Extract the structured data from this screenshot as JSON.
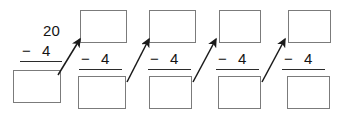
{
  "worksheet": {
    "title": "repeated-subtraction-chain",
    "start_value": "20",
    "operator_sign": "−",
    "operand": "4",
    "num_columns": 5,
    "colors": {
      "box_border": "#7b7b7b",
      "text": "#141414",
      "rule": "#2b2b2b",
      "arrow": "#1a1a1a",
      "background": "#ffffff"
    },
    "columns": [
      {
        "index": 1,
        "top_kind": "number",
        "top_value": "20",
        "operator_sign": "−",
        "operand": "4",
        "bottom_kind": "box",
        "bottom_value": ""
      },
      {
        "index": 2,
        "top_kind": "box",
        "top_value": "",
        "operator_sign": "−",
        "operand": "4",
        "bottom_kind": "box",
        "bottom_value": ""
      },
      {
        "index": 3,
        "top_kind": "box",
        "top_value": "",
        "operator_sign": "−",
        "operand": "4",
        "bottom_kind": "box",
        "bottom_value": ""
      },
      {
        "index": 4,
        "top_kind": "box",
        "top_value": "",
        "operator_sign": "−",
        "operand": "4",
        "bottom_kind": "box",
        "bottom_value": ""
      },
      {
        "index": 5,
        "top_kind": "box",
        "top_value": "",
        "operator_sign": "−",
        "operand": "4",
        "bottom_kind": "box",
        "bottom_value": ""
      }
    ],
    "arrows": [
      {
        "index": 1,
        "from_column": 1,
        "to_column": 2
      },
      {
        "index": 2,
        "from_column": 2,
        "to_column": 3
      },
      {
        "index": 3,
        "from_column": 3,
        "to_column": 4
      },
      {
        "index": 4,
        "from_column": 4,
        "to_column": 5
      }
    ]
  }
}
